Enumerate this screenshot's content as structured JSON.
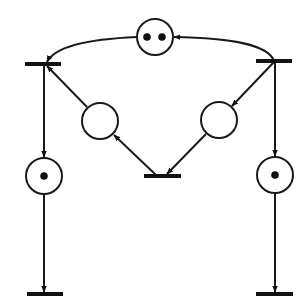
{
  "diagram": {
    "type": "petri-net",
    "stroke_color": "#1a1a1a",
    "background": "#ffffff",
    "places": [
      {
        "id": "p_top",
        "cx": 155,
        "cy": 37,
        "r": 18,
        "tokens": 2
      },
      {
        "id": "p_mid_left",
        "cx": 100,
        "cy": 121,
        "r": 18,
        "tokens": 0
      },
      {
        "id": "p_mid_right",
        "cx": 219,
        "cy": 120,
        "r": 18,
        "tokens": 0
      },
      {
        "id": "p_low_left",
        "cx": 44,
        "cy": 176,
        "r": 18,
        "tokens": 1
      },
      {
        "id": "p_low_right",
        "cx": 275,
        "cy": 175,
        "r": 18,
        "tokens": 1
      }
    ],
    "transitions": [
      {
        "id": "t_top_left",
        "x1": 25,
        "x2": 61,
        "y": 64
      },
      {
        "id": "t_top_right",
        "x1": 256,
        "x2": 292,
        "y": 61
      },
      {
        "id": "t_mid_bottom",
        "x1": 144,
        "x2": 181,
        "y": 176
      },
      {
        "id": "t_bottom_left",
        "x1": 27,
        "x2": 63,
        "y": 294
      },
      {
        "id": "t_bottom_right",
        "x1": 256,
        "x2": 293,
        "y": 294
      }
    ],
    "arcs": [
      {
        "from": "t_top_right",
        "to": "p_top"
      },
      {
        "from": "p_top",
        "to": "t_top_left"
      },
      {
        "from": "t_top_right",
        "to": "p_mid_right"
      },
      {
        "from": "p_mid_right",
        "to": "t_mid_bottom"
      },
      {
        "from": "t_mid_bottom",
        "to": "p_mid_left"
      },
      {
        "from": "p_mid_left",
        "to": "t_top_left"
      },
      {
        "from": "t_top_left",
        "to": "p_low_left"
      },
      {
        "from": "p_low_left",
        "to": "t_bottom_left"
      },
      {
        "from": "t_top_right",
        "to": "p_low_right"
      },
      {
        "from": "p_low_right",
        "to": "t_bottom_right"
      }
    ]
  }
}
